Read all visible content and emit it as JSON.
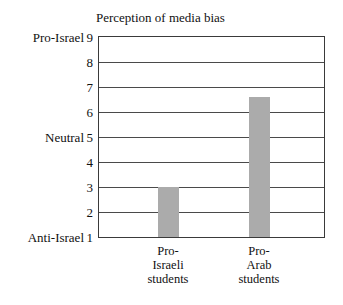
{
  "chart_data": {
    "type": "bar",
    "title": "Perception of media bias",
    "xlabel": "",
    "ylabel": "",
    "categories": [
      "Pro-Israeli students",
      "Pro-Arab students"
    ],
    "category_lines": [
      [
        "Pro-",
        "Israeli",
        "students"
      ],
      [
        "Pro-",
        "Arab",
        "students"
      ]
    ],
    "values": [
      3,
      6.6
    ],
    "ylim": [
      1,
      9
    ],
    "ytick_labels": [
      "9",
      "8",
      "7",
      "6",
      "5",
      "4",
      "3",
      "2",
      "1"
    ],
    "ytick_values": [
      9,
      8,
      7,
      6,
      5,
      4,
      3,
      2,
      1
    ],
    "y_anchor_labels": [
      {
        "text": "Pro-Israel",
        "value": 9
      },
      {
        "text": "Neutral",
        "value": 5
      },
      {
        "text": "Anti-Israel",
        "value": 1
      }
    ],
    "grid": true,
    "legend": "none",
    "bar_color": "#ababab",
    "frame_color": "#3a3a3a"
  }
}
